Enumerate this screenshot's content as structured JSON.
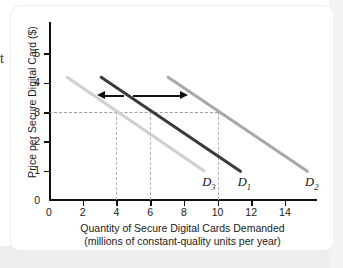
{
  "figure": {
    "edge_fragment": "t",
    "background_color": "#ffffff",
    "card_color": "#ffffff"
  },
  "chart_data": {
    "type": "line",
    "title": "",
    "xlabel": "Quantity of Secure Digital Cards Demanded",
    "xlabel_sub": "(millions of constant-quality units per year)",
    "ylabel": "Price per Secure Digital Card ($)",
    "xlim": [
      0,
      15.8
    ],
    "ylim": [
      0,
      5.5
    ],
    "xticks": [
      0,
      2,
      4,
      6,
      8,
      10,
      12,
      14
    ],
    "xtick_labels": [
      "0",
      "2",
      "4",
      "6",
      "8",
      "10",
      "12",
      "14"
    ],
    "yticks": [
      0,
      1,
      2,
      3,
      4,
      5
    ],
    "ytick_labels": [
      "0",
      "1",
      "2",
      "3",
      "4",
      "5"
    ],
    "grid": false,
    "legend_position": "inline-curve-labels",
    "series": [
      {
        "name": "D3",
        "label": "D",
        "sub": "3",
        "color": "#cfcfcf",
        "width_px": 2.6,
        "points": [
          [
            1.0,
            4.2
          ],
          [
            9.3,
            0.95
          ]
        ],
        "label_xy": [
          9.1,
          0.55
        ]
      },
      {
        "name": "D1",
        "label": "D",
        "sub": "1",
        "color": "#3a3a3a",
        "width_px": 2.8,
        "points": [
          [
            3.0,
            4.2
          ],
          [
            11.4,
            0.95
          ]
        ],
        "label_xy": [
          11.2,
          0.55
        ]
      },
      {
        "name": "D2",
        "label": "D",
        "sub": "2",
        "color": "#a8a8a8",
        "width_px": 2.6,
        "points": [
          [
            7.0,
            4.2
          ],
          [
            15.4,
            0.95
          ]
        ],
        "label_xy": [
          15.2,
          0.55
        ]
      }
    ],
    "reference_lines": {
      "horizontal": [
        {
          "name": "price-3-dashed",
          "y": 3.0,
          "x_from": 0.0,
          "x_to": 10.0,
          "color": "#9c9c9c"
        }
      ],
      "vertical": [
        {
          "name": "quantity-4-dashed",
          "x": 4.0,
          "y_from": 0.0,
          "y_to": 3.0,
          "color": "#b5b5b5"
        },
        {
          "name": "quantity-6-dashed",
          "x": 6.0,
          "y_from": 0.0,
          "y_to": 3.0,
          "color": "#b5b5b5"
        },
        {
          "name": "quantity-10-dashed",
          "x": 10.0,
          "y_from": 0.0,
          "y_to": 3.0,
          "color": "#b5b5b5"
        }
      ]
    },
    "annotations": [
      {
        "name": "leftward-shift-arrow",
        "type": "arrow",
        "direction": "left",
        "y": 3.55,
        "x_from": 4.45,
        "x_to": 2.85,
        "color": "#111111"
      },
      {
        "name": "rightward-shift-arrow",
        "type": "arrow",
        "direction": "right",
        "y": 3.55,
        "x_from": 5.0,
        "x_to": 8.25,
        "color": "#111111"
      }
    ]
  }
}
